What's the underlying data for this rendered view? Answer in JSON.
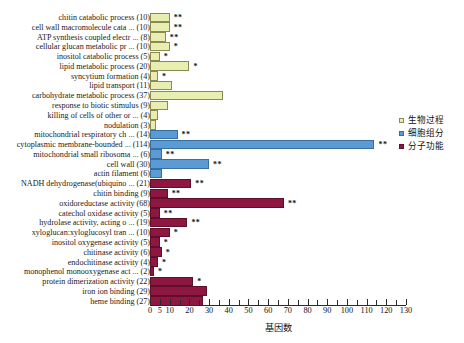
{
  "chart_data": {
    "type": "bar",
    "orientation": "horizontal",
    "title": "",
    "xlabel": "基因数",
    "ylabel": "",
    "xlim": [
      0,
      130
    ],
    "xticks": [
      0,
      5,
      10,
      15,
      20,
      25,
      30,
      35,
      40,
      45,
      50,
      55,
      60,
      65,
      70,
      75,
      80,
      85,
      90,
      95,
      100,
      105,
      110,
      115,
      120,
      125,
      130
    ],
    "xtick_labels": [
      "0",
      "5",
      "10",
      "",
      "20",
      "",
      "30",
      "",
      "40",
      "",
      "50",
      "",
      "60",
      "",
      "70",
      "",
      "80",
      "",
      "90",
      "",
      "100",
      "",
      "110",
      "",
      "120",
      "",
      "130"
    ],
    "grid": false,
    "legend_position": "right",
    "series": [
      {
        "name": "生物过程",
        "key": "bp",
        "color": "#e8edb0",
        "border": "#8a8a57"
      },
      {
        "name": "细胞组分",
        "key": "cc",
        "color": "#5b9bd5",
        "border": "#3a6e9e"
      },
      {
        "name": "分子功能",
        "key": "mf",
        "color": "#8e1741",
        "border": "#5e0f2c"
      }
    ],
    "categories": [
      {
        "label": "chitin catabolic process (10)",
        "value": 10,
        "group": "bp",
        "sig": "**"
      },
      {
        "label": "cell wall macromolecule cata ... (10)",
        "value": 10,
        "group": "bp",
        "sig": "**"
      },
      {
        "label": "ATP synthesis coupled electr ... (8)",
        "value": 8,
        "group": "bp",
        "sig": "**"
      },
      {
        "label": "cellular glucan metabolic pr ... (10)",
        "value": 10,
        "group": "bp",
        "sig": "*"
      },
      {
        "label": "inositol catabolic process (5)",
        "value": 5,
        "group": "bp",
        "sig": "*"
      },
      {
        "label": "lipid metabolic process (20)",
        "value": 20,
        "group": "bp",
        "sig": "*"
      },
      {
        "label": "syncytium formation (4)",
        "value": 4,
        "group": "bp",
        "sig": "*"
      },
      {
        "label": "lipid transport (11)",
        "value": 11,
        "group": "bp",
        "sig": ""
      },
      {
        "label": "carbohydrate metabolic process (37)",
        "value": 37,
        "group": "bp",
        "sig": ""
      },
      {
        "label": "response to biotic stimulus (9)",
        "value": 9,
        "group": "bp",
        "sig": ""
      },
      {
        "label": "killing of cells of other or ... (4)",
        "value": 4,
        "group": "bp",
        "sig": ""
      },
      {
        "label": "nodulation (3)",
        "value": 3,
        "group": "bp",
        "sig": ""
      },
      {
        "label": "mitochondrial respiratory ch ... (14)",
        "value": 14,
        "group": "cc",
        "sig": "**"
      },
      {
        "label": "cytoplasmic membrane-bounded ... (114)",
        "value": 114,
        "group": "cc",
        "sig": "**"
      },
      {
        "label": "mitochondrial small ribosoma ... (6)",
        "value": 6,
        "group": "cc",
        "sig": "**"
      },
      {
        "label": "cell wall (30)",
        "value": 30,
        "group": "cc",
        "sig": "**"
      },
      {
        "label": "actin filament (6)",
        "value": 6,
        "group": "cc",
        "sig": ""
      },
      {
        "label": "NADH dehydrogenase(ubiquino ... (21)",
        "value": 21,
        "group": "mf",
        "sig": "**"
      },
      {
        "label": "chitin binding (9)",
        "value": 9,
        "group": "mf",
        "sig": "**"
      },
      {
        "label": "oxidoreductase activity (68)",
        "value": 68,
        "group": "mf",
        "sig": "**"
      },
      {
        "label": "catechol oxidase activity (5)",
        "value": 5,
        "group": "mf",
        "sig": "**"
      },
      {
        "label": "hydrolase activity, acting o ... (19)",
        "value": 19,
        "group": "mf",
        "sig": "**"
      },
      {
        "label": "xyloglucan:xyloglucosyl tran ... (10)",
        "value": 10,
        "group": "mf",
        "sig": "*"
      },
      {
        "label": "inositol oxygenase activity (5)",
        "value": 5,
        "group": "mf",
        "sig": "*"
      },
      {
        "label": "chitinase activity (6)",
        "value": 6,
        "group": "mf",
        "sig": "*"
      },
      {
        "label": "endochitinase activity (4)",
        "value": 4,
        "group": "mf",
        "sig": "*"
      },
      {
        "label": "monophenol monooxygenase act ... (2)",
        "value": 2,
        "group": "mf",
        "sig": "*"
      },
      {
        "label": "protein dimerization activity (22)",
        "value": 22,
        "group": "mf",
        "sig": "*"
      },
      {
        "label": "iron ion binding (29)",
        "value": 29,
        "group": "mf",
        "sig": ""
      },
      {
        "label": "heme binding (27)",
        "value": 27,
        "group": "mf",
        "sig": ""
      }
    ]
  }
}
